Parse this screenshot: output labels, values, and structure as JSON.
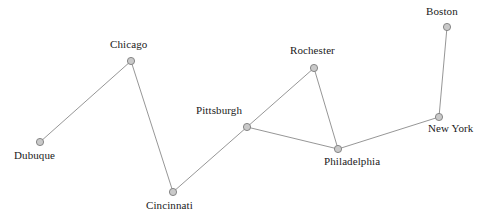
{
  "figure": {
    "type": "node-link-graph",
    "title": "",
    "background_color": "#ffffff",
    "width": 492,
    "height": 220
  },
  "style": {
    "node_fill": "#c9c9c9",
    "node_stroke": "#7d7d7d",
    "node_radius": 3.6,
    "edge_color": "#8a8a8a",
    "edge_width": 0.9,
    "label_color": "#1a1a1a",
    "label_size": 11
  },
  "chart_data": {
    "type": "scatter",
    "title": "",
    "xlabel": "",
    "ylabel": "",
    "grid": false,
    "legend": "none",
    "xlim": [
      0,
      492
    ],
    "ylim": [
      0,
      220
    ],
    "nodes": [
      {
        "id": "dubuque",
        "label": "Dubuque",
        "x": 40,
        "y": 142,
        "label_x": 14,
        "label_y": 149,
        "label_anchor": "below-left"
      },
      {
        "id": "chicago",
        "label": "Chicago",
        "x": 131,
        "y": 61,
        "label_x": 110,
        "label_y": 38,
        "label_anchor": "above"
      },
      {
        "id": "cincinnati",
        "label": "Cincinnati",
        "x": 173,
        "y": 192,
        "label_x": 146,
        "label_y": 199,
        "label_anchor": "below"
      },
      {
        "id": "pittsburgh",
        "label": "Pittsburgh",
        "x": 247,
        "y": 127,
        "label_x": 196,
        "label_y": 104,
        "label_anchor": "above-left"
      },
      {
        "id": "rochester",
        "label": "Rochester",
        "x": 314,
        "y": 68,
        "label_x": 290,
        "label_y": 44,
        "label_anchor": "above"
      },
      {
        "id": "philadelphia",
        "label": "Philadelphia",
        "x": 338,
        "y": 149,
        "label_x": 324,
        "label_y": 155,
        "label_anchor": "below"
      },
      {
        "id": "newyork",
        "label": "New York",
        "x": 439,
        "y": 117,
        "label_x": 428,
        "label_y": 122,
        "label_anchor": "below-left"
      },
      {
        "id": "boston",
        "label": "Boston",
        "x": 447,
        "y": 27,
        "label_x": 426,
        "label_y": 5,
        "label_anchor": "above"
      }
    ],
    "edges": [
      {
        "id": "dubuque-chicago",
        "source": "dubuque",
        "target": "chicago"
      },
      {
        "id": "chicago-cincinnati",
        "source": "chicago",
        "target": "cincinnati"
      },
      {
        "id": "cincinnati-pittsburgh",
        "source": "cincinnati",
        "target": "pittsburgh"
      },
      {
        "id": "pittsburgh-rochester",
        "source": "pittsburgh",
        "target": "rochester"
      },
      {
        "id": "pittsburgh-philadelphia",
        "source": "pittsburgh",
        "target": "philadelphia"
      },
      {
        "id": "rochester-philadelphia",
        "source": "rochester",
        "target": "philadelphia"
      },
      {
        "id": "philadelphia-newyork",
        "source": "philadelphia",
        "target": "newyork"
      },
      {
        "id": "newyork-boston",
        "source": "newyork",
        "target": "boston"
      }
    ]
  }
}
